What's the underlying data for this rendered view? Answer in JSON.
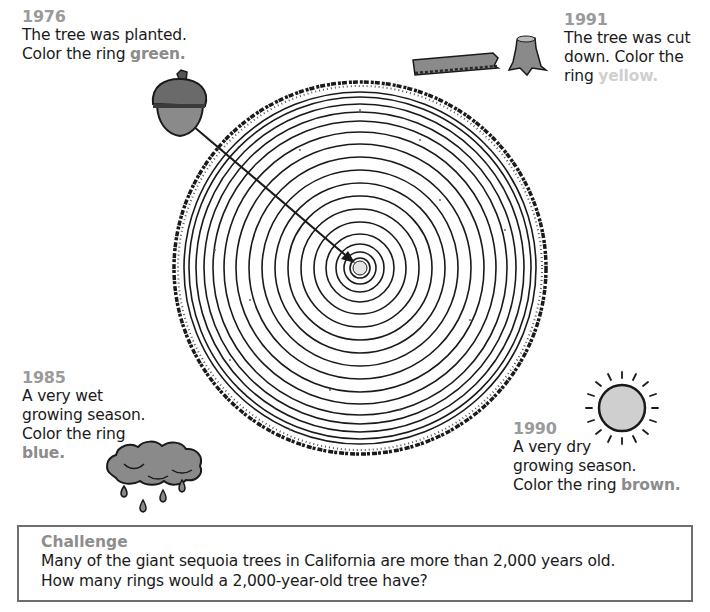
{
  "notes": {
    "n1976": {
      "year": "1976",
      "lines": [
        "The tree was planted."
      ],
      "prefix": "Color the ring ",
      "color_word": "green",
      "suffix": "."
    },
    "n1991": {
      "year": "1991",
      "lines": [
        "The tree was cut",
        "down. Color the"
      ],
      "prefix": "ring ",
      "color_word": "yellow",
      "suffix": "."
    },
    "n1985": {
      "year": "1985",
      "lines": [
        "A very wet",
        "growing season.",
        "Color the ring"
      ],
      "prefix": "",
      "color_word": "blue",
      "suffix": "."
    },
    "n1990": {
      "year": "1990",
      "lines": [
        "A very dry",
        "growing season."
      ],
      "prefix": "Color the ring ",
      "color_word": "brown",
      "suffix": "."
    }
  },
  "challenge": {
    "title": "Challenge",
    "lines": [
      "Many of the giant sequoia trees in California are more than 2,000 years old.",
      "How many rings would a 2,000-year-old tree have?"
    ]
  },
  "illustrations": {
    "acorn": "acorn-icon",
    "log_and_stump": "cut-tree-icon",
    "cloud": "rain-cloud-icon",
    "sun": "sun-icon",
    "tree_cross_section": {
      "ring_count": 16,
      "start_year": "1976",
      "end_year": "1991"
    }
  },
  "colors": {
    "year_label": "#9a9a9a",
    "illustration_fill": "#8a8a8a",
    "ink": "#1a1a1a",
    "border": "#6e6e6e"
  }
}
